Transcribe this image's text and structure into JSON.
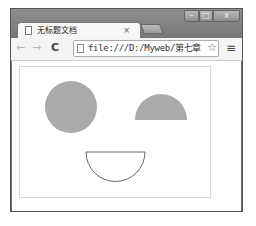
{
  "window": {
    "controls": {
      "minimize": "–",
      "maximize": "□",
      "close": "x"
    }
  },
  "tab": {
    "title": "无标题文档",
    "close": "×"
  },
  "toolbar": {
    "back": "←",
    "forward": "→",
    "reload": "C",
    "url": "file:///D:/Myweb/第七章",
    "star": "☆",
    "menu": "≡"
  },
  "canvas": {
    "shapes": [
      {
        "type": "circle",
        "fill": "#aaaaaa",
        "label": "left-eye"
      },
      {
        "type": "half-circle",
        "fill": "#aaaaaa",
        "label": "right-eye"
      },
      {
        "type": "half-circle-outline",
        "stroke": "#666666",
        "label": "mouth"
      }
    ]
  }
}
